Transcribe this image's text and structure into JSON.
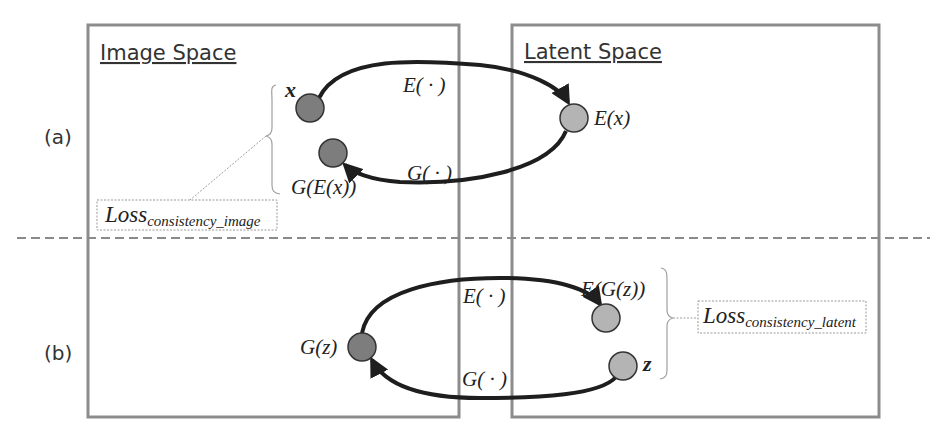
{
  "panels": {
    "image_space": {
      "title": "Image Space"
    },
    "latent_space": {
      "title": "Latent Space"
    }
  },
  "rows": {
    "a": {
      "label": "(a)",
      "nodes": {
        "x": "x",
        "ex": "E(x)",
        "gex": "G(E(x))"
      },
      "arrows": {
        "encoder": "E( · )",
        "generator": "G( · )"
      },
      "loss": {
        "main": "Loss",
        "sub": "consistency_image"
      }
    },
    "b": {
      "label": "(b)",
      "nodes": {
        "gz": "G(z)",
        "egz": "E(G(z))",
        "z": "z"
      },
      "arrows": {
        "encoder": "E( · )",
        "generator": "G( · )"
      },
      "loss": {
        "main": "Loss",
        "sub": "consistency_latent"
      }
    }
  },
  "colors": {
    "panel_border": "#8c8c8c",
    "image_node": "#7d7d7d",
    "latent_node": "#b4b4b4",
    "arrow": "#1e1e1e",
    "dashed_divider": "#8a8a8a"
  }
}
